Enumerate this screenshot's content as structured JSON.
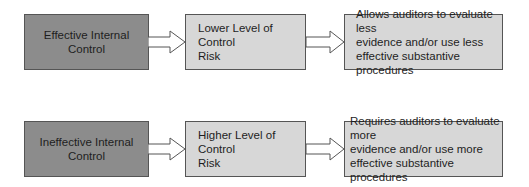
{
  "rows": [
    {
      "cause": "Effective Internal Control",
      "risk_line1": "Lower Level of Control",
      "risk_line2": "Risk",
      "effect_line1": "Allows auditors to evaluate less",
      "effect_line2": "evidence and/or use less",
      "effect_line3": "effective substantive procedures"
    },
    {
      "cause": "Ineffective Internal Control",
      "risk_line1": "Higher Level of Control",
      "risk_line2": "Risk",
      "effect_line1": "Requires auditors to evaluate more",
      "effect_line2": "evidence and/or use more",
      "effect_line3": "effective substantive procedures"
    }
  ],
  "colors": {
    "cause_fill": "#8c8c8c",
    "box_fill": "#d7d7d7",
    "border": "#555555",
    "arrow_fill": "#ffffff"
  }
}
